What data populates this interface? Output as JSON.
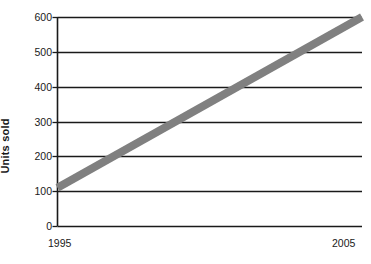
{
  "chart_data": {
    "type": "line",
    "title": "",
    "subtitle": "",
    "xlabel": "",
    "ylabel": "Units sold",
    "x": [
      1995,
      2005
    ],
    "series": [
      {
        "name": "Units sold",
        "values": [
          110,
          600
        ],
        "color": "#808080"
      }
    ],
    "xlim": [
      1995,
      2005
    ],
    "ylim": [
      0,
      600
    ],
    "ytick_labels": [
      "0",
      "100",
      "200",
      "300",
      "400",
      "500",
      "600"
    ],
    "ytick_values": [
      0,
      100,
      200,
      300,
      400,
      500,
      600
    ],
    "xtick_labels": [
      "1995",
      "2005"
    ],
    "xtick_values": [
      1995,
      2005
    ],
    "grid": "horizontal",
    "legend": "none",
    "annotations": [],
    "axis_color": "#1a1a1a",
    "background": "#ffffff"
  },
  "axis": {
    "y_title": "Units sold",
    "ticks_y": [
      {
        "label": "600",
        "value": 600
      },
      {
        "label": "500",
        "value": 500
      },
      {
        "label": "400",
        "value": 400
      },
      {
        "label": "300",
        "value": 300
      },
      {
        "label": "200",
        "value": 200
      },
      {
        "label": "100",
        "value": 100
      },
      {
        "label": "0",
        "value": 0
      }
    ],
    "ticks_x": [
      {
        "label": "1995",
        "value": 1995
      },
      {
        "label": "2005",
        "value": 2005
      }
    ]
  }
}
